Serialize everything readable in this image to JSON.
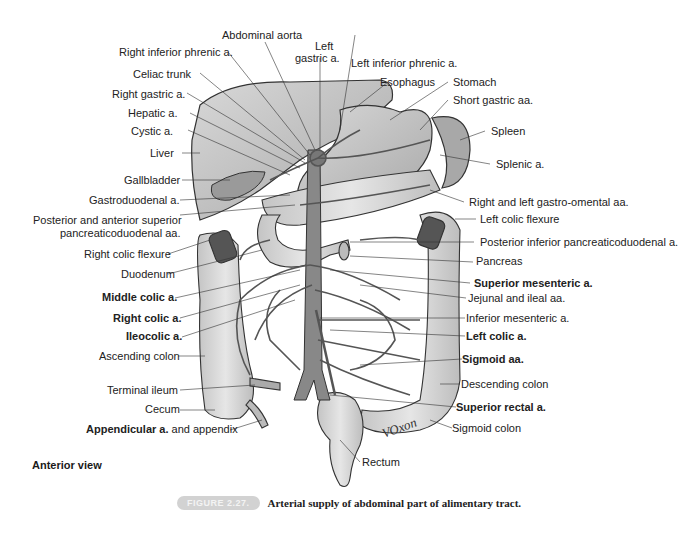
{
  "figure": {
    "view": "Anterior view",
    "caption_number": "FIGURE 2.27.",
    "caption_text": "Arterial supply of abdominal part of alimentary tract.",
    "signature": "VOxon"
  },
  "labels_top": [
    {
      "id": "abdominal-aorta",
      "text": "Abdominal aorta"
    },
    {
      "id": "right-inferior-phrenic",
      "text": "Right inferior phrenic a."
    },
    {
      "id": "left-gastric-1",
      "text": "Left"
    },
    {
      "id": "left-gastric-2",
      "text": "gastric a."
    },
    {
      "id": "left-inferior-phrenic",
      "text": "Left inferior phrenic a."
    }
  ],
  "labels_left": [
    {
      "id": "celiac-trunk",
      "text": "Celiac trunk",
      "bold": false
    },
    {
      "id": "right-gastric",
      "text": "Right gastric a.",
      "bold": false
    },
    {
      "id": "hepatic",
      "text": "Hepatic a.",
      "bold": false
    },
    {
      "id": "cystic",
      "text": "Cystic a.",
      "bold": false
    },
    {
      "id": "liver",
      "text": "Liver",
      "bold": false
    },
    {
      "id": "gallbladder",
      "text": "Gallbladder",
      "bold": false
    },
    {
      "id": "gastroduodenal",
      "text": "Gastroduodenal a.",
      "bold": false
    },
    {
      "id": "post-ant-sup-1",
      "text": "Posterior and anterior superior",
      "bold": false
    },
    {
      "id": "post-ant-sup-2",
      "text": "pancreaticoduodenal aa.",
      "bold": false
    },
    {
      "id": "right-colic-flexure",
      "text": "Right colic flexure",
      "bold": false
    },
    {
      "id": "duodenum",
      "text": "Duodenum",
      "bold": false
    },
    {
      "id": "middle-colic",
      "text": "Middle colic a.",
      "bold": true
    },
    {
      "id": "right-colic",
      "text": "Right colic a.",
      "bold": true
    },
    {
      "id": "ileocolic",
      "text": "Ileocolic a.",
      "bold": true
    },
    {
      "id": "ascending-colon",
      "text": "Ascending colon",
      "bold": false
    },
    {
      "id": "terminal-ileum",
      "text": "Terminal ileum",
      "bold": false
    },
    {
      "id": "cecum",
      "text": "Cecum",
      "bold": false
    },
    {
      "id": "appendicular-bold",
      "text": "Appendicular a.",
      "bold": true
    },
    {
      "id": "appendicular-rest",
      "text": " and appendix",
      "bold": false
    }
  ],
  "labels_right": [
    {
      "id": "esophagus",
      "text": "Esophagus",
      "bold": false
    },
    {
      "id": "stomach",
      "text": "Stomach",
      "bold": false
    },
    {
      "id": "short-gastric",
      "text": "Short gastric aa.",
      "bold": false
    },
    {
      "id": "spleen",
      "text": "Spleen",
      "bold": false
    },
    {
      "id": "splenic",
      "text": "Splenic a.",
      "bold": false
    },
    {
      "id": "gastro-omental",
      "text": "Right and left gastro-omental aa.",
      "bold": false
    },
    {
      "id": "left-colic-flexure",
      "text": "Left colic flexure",
      "bold": false
    },
    {
      "id": "post-inf-pancreatico",
      "text": "Posterior inferior pancreaticoduodenal a.",
      "bold": false
    },
    {
      "id": "pancreas",
      "text": "Pancreas",
      "bold": false
    },
    {
      "id": "superior-mesenteric",
      "text": "Superior mesenteric a.",
      "bold": true
    },
    {
      "id": "jejunal-ileal",
      "text": "Jejunal and ileal aa.",
      "bold": false
    },
    {
      "id": "inferior-mesenteric",
      "text": "Inferior mesenteric a.",
      "bold": false
    },
    {
      "id": "left-colic",
      "text": "Left colic a.",
      "bold": true
    },
    {
      "id": "sigmoid-aa",
      "text": "Sigmoid aa.",
      "bold": true
    },
    {
      "id": "descending-colon",
      "text": "Descending colon",
      "bold": false
    },
    {
      "id": "superior-rectal",
      "text": "Superior rectal a.",
      "bold": true
    },
    {
      "id": "sigmoid-colon",
      "text": "Sigmoid colon",
      "bold": false
    },
    {
      "id": "rectum",
      "text": "Rectum",
      "bold": false
    }
  ],
  "colors": {
    "organ_fill": "#b8b8b8",
    "organ_light": "#dcdcdc",
    "organ_stroke": "#333333",
    "vessel": "#555555",
    "leader": "#333333",
    "badge_bg": "#d2d2d2"
  }
}
